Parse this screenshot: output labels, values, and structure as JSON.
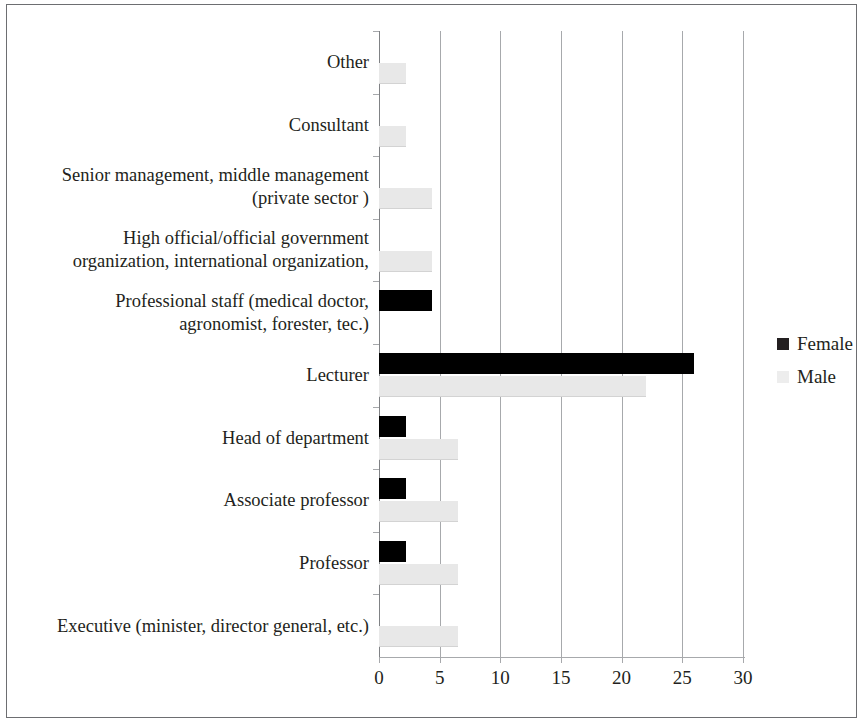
{
  "chart_data": {
    "type": "bar",
    "orientation": "horizontal",
    "title": "",
    "subtitle": "",
    "xlabel": "",
    "ylabel": "",
    "xlim": [
      0,
      30
    ],
    "xticks": [
      "0",
      "5",
      "10",
      "15",
      "20",
      "25",
      "30"
    ],
    "grid": true,
    "legend_position": "right",
    "categories": [
      "Other",
      "Consultant",
      "Senior management, middle management\n(private sector )",
      "High official/official government\norganization, international organization,",
      "Professional staff (medical doctor,\nagronomist, forester, tec.)",
      "Lecturer",
      "Head of department",
      "Associate professor",
      "Professor",
      "Executive (minister, director general, etc.)"
    ],
    "series": [
      {
        "name": "Female",
        "color": "#000000",
        "values": [
          0,
          0,
          0,
          0,
          4.4,
          26,
          2.2,
          2.2,
          2.2,
          0
        ]
      },
      {
        "name": "Male",
        "color": "#e8e8e8",
        "values": [
          2.2,
          2.2,
          4.4,
          4.4,
          0,
          22,
          6.5,
          6.5,
          6.5,
          6.5
        ]
      }
    ],
    "legend": [
      {
        "label": "Female",
        "swatch": "female"
      },
      {
        "label": "Male",
        "swatch": "male"
      }
    ]
  }
}
